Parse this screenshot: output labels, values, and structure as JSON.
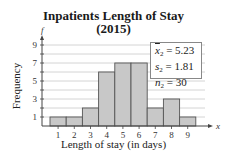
{
  "chart_data": {
    "type": "bar",
    "title": "Inpatients Length of Stay",
    "subtitle": "(2015)",
    "xlabel": "Length of stay (in days)",
    "ylabel": "Frequency",
    "x_axis_symbol": "x",
    "y_axis_symbol": "f",
    "categories": [
      "1",
      "2",
      "3",
      "4",
      "5",
      "6",
      "7",
      "8",
      "9"
    ],
    "values": [
      1,
      1,
      2,
      6,
      7,
      7,
      2,
      3,
      1
    ],
    "y_ticks": [
      "1",
      "3",
      "5",
      "7",
      "9"
    ],
    "ylim": [
      0,
      9
    ],
    "grid": true,
    "legend_position": "top-right",
    "annotations": [
      {
        "label": "x̄₂",
        "value": "5.23"
      },
      {
        "label": "s₂",
        "value": "1.81"
      },
      {
        "label": "n₂",
        "value": "30"
      }
    ],
    "colors": {
      "bar_fill": "#c8c8c8",
      "bar_stroke": "#555555",
      "grid": "#c9c9c9"
    }
  },
  "legend": {
    "mean_label": "x",
    "mean_value": "= 5.23",
    "sd_label": "s",
    "sd_value": "= 1.81",
    "n_label": "n",
    "n_value": "= 30",
    "subscript": "2"
  }
}
